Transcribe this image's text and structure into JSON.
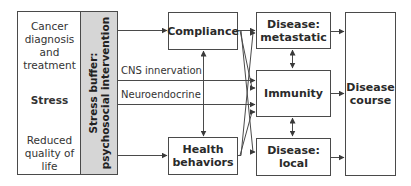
{
  "diagram": {
    "left_column": {
      "origin": "Cancer diagnosis and treatment",
      "origin_lines": [
        "Cancer",
        "diagnosis",
        "and",
        "treatment"
      ],
      "middle": "Stress",
      "outcome_lines": [
        "Reduced",
        "quality of",
        "life"
      ]
    },
    "buffer": {
      "line1": "Stress buffer:",
      "line2": "psychosocial intervention"
    },
    "pathways": {
      "cns": "CNS innervation",
      "neuroendocrine": "Neuroendocrine"
    },
    "boxes": {
      "compliance": "Compliance",
      "health_behaviors_line1": "Health",
      "health_behaviors_line2": "behaviors",
      "metastatic_line1": "Disease:",
      "metastatic_line2": "metastatic",
      "immunity": "Immunity",
      "local_line1": "Disease:",
      "local_line2": "local",
      "course_line1": "Disease",
      "course_line2": "course"
    },
    "colors": {
      "line": "#4a4a4a",
      "buffer_fill": "#d6d6d6",
      "text": "#2a2a2a"
    }
  }
}
